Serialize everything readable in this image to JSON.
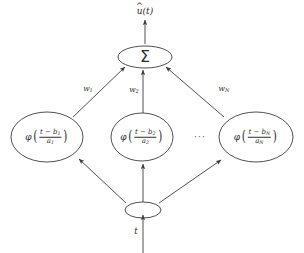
{
  "figure": {
    "background_color": "#ffffff",
    "line_color": "#3c3c3c",
    "text_color": "#2b2b2b"
  },
  "output": {
    "label": "u(t)",
    "base_symbol": "u",
    "accent": "^",
    "argument": "(t)"
  },
  "summation": {
    "symbol": "Σ",
    "name": "summation-node"
  },
  "input": {
    "label": "t",
    "node_name": "input-fanout-node"
  },
  "ellipsis": {
    "label": "···"
  },
  "weights": [
    {
      "label": "w",
      "subscript": "1"
    },
    {
      "label": "w",
      "subscript": "2"
    },
    {
      "label": "w",
      "subscript": "N"
    }
  ],
  "wavelet_nodes": [
    {
      "phi": "φ",
      "numerator": "t − b",
      "numerator_sub": "1",
      "denominator": "a",
      "denominator_sub": "1"
    },
    {
      "phi": "φ",
      "numerator": "t − b",
      "numerator_sub": "2",
      "denominator": "a",
      "denominator_sub": "2"
    },
    {
      "phi": "φ",
      "numerator": "t − b",
      "numerator_sub": "N",
      "denominator": "a",
      "denominator_sub": "N"
    }
  ],
  "parens": {
    "left": "(",
    "right": ")"
  }
}
